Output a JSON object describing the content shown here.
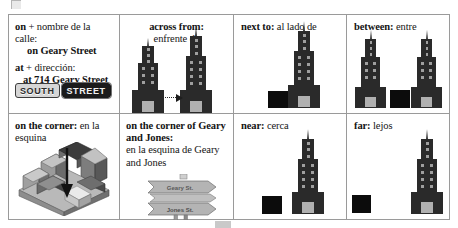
{
  "page": {
    "artifacts": [
      "top-left-gray-notch",
      "bottom-center-gray-bar"
    ]
  },
  "table": {
    "rows": [
      {
        "cells": [
          {
            "id": "on-at",
            "lines": [
              {
                "bold": "on",
                "plain": " + nombre de la calle:"
              },
              {
                "bold": "on Geary Street",
                "plain": ""
              },
              {
                "bold": "at",
                "plain": " + dirección:"
              },
              {
                "bold": "at 714 Geary Street",
                "plain": ""
              }
            ],
            "graphic": "street-name-signs",
            "signs": [
              {
                "label": "SOUTH",
                "style": "light"
              },
              {
                "label": "STREET",
                "style": "dark"
              }
            ]
          },
          {
            "id": "across-from",
            "term_en": "across from:",
            "term_es": "enfrente de",
            "graphic": "two-buildings-with-dotted-arrow",
            "buildings": 2
          },
          {
            "id": "next-to",
            "term_en": "next to:",
            "term_es": "al lado de",
            "graphic": "building-with-adjacent-black-box",
            "buildings": 1
          },
          {
            "id": "between",
            "term_en": "between:",
            "term_es": "entre",
            "graphic": "black-box-between-two-buildings",
            "buildings": 2
          }
        ]
      },
      {
        "cells": [
          {
            "id": "on-the-corner",
            "term_en": "on the corner:",
            "term_es": "en la esquina",
            "graphic": "isometric-city-block-with-down-arrow"
          },
          {
            "id": "on-the-corner-of",
            "term_en": "on the corner of Geary and Jones:",
            "term_es": "en la esquina de Geary and Jones",
            "graphic": "crossroads-signpost",
            "signpost": [
              {
                "label": "Geary St."
              },
              {
                "label": "Jones St."
              }
            ]
          },
          {
            "id": "near",
            "term_en": "near:",
            "term_es": "cerca",
            "graphic": "black-box-close-to-building"
          },
          {
            "id": "far",
            "term_en": "far:",
            "term_es": "lejos",
            "graphic": "black-box-far-from-building"
          }
        ]
      }
    ]
  },
  "colors": {
    "ink": "#141414",
    "rule": "#9a9a9a",
    "building": "#2a2a2a",
    "window": "#9f9f9f",
    "box": "#0c0c0c",
    "page": "#ffffff"
  }
}
